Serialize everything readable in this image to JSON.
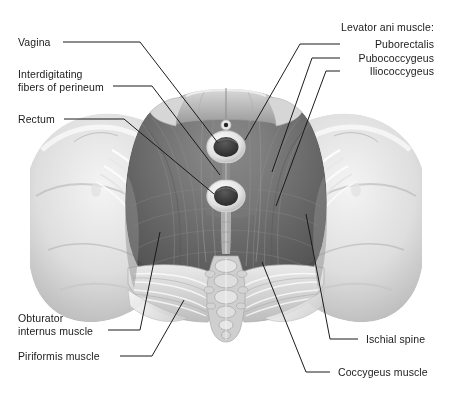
{
  "figure": {
    "background_color": "#ffffff",
    "label_color": "#1a1a1a",
    "leader_color": "#1b1b1b",
    "view": "inferior (perineal) view of the female bony pelvis and pelvic diaphragm",
    "rendering": "grayscale medical illustration"
  },
  "labels": {
    "vagina": "Vagina",
    "interdigitating_line1": "Interdigitating",
    "interdigitating_line2": "fibers of perineum",
    "rectum": "Rectum",
    "obturator_line1": "Obturator",
    "obturator_line2": "internus muscle",
    "piriformis": "Piriformis muscle",
    "levator_heading": "Levator ani muscle:",
    "puborectalis": "Puborectalis",
    "pubococcygeus": "Pubococcygeus",
    "iliococcygeus": "Iliococcygeus",
    "ischial_spine": "Ischial spine",
    "coccygeus": "Coccygeus muscle"
  },
  "structures": [
    {
      "name": "pubic-symphysis",
      "tone": "#b9b9b9"
    },
    {
      "name": "hip-bone-left",
      "tone": "#dcdcdc"
    },
    {
      "name": "hip-bone-right",
      "tone": "#dcdcdc"
    },
    {
      "name": "ischial-spine-left",
      "tone": "#e6e6e6"
    },
    {
      "name": "ischial-spine-right",
      "tone": "#e6e6e6"
    },
    {
      "name": "sacrotuberous-ligament-left",
      "tone": "#efefef"
    },
    {
      "name": "sacrotuberous-ligament-right",
      "tone": "#efefef"
    },
    {
      "name": "levator-ani-sheet",
      "tone": "#6f6f6f"
    },
    {
      "name": "puborectalis-sling",
      "tone": "#7a7a7a"
    },
    {
      "name": "pubococcygeus",
      "tone": "#636363"
    },
    {
      "name": "iliococcygeus",
      "tone": "#5c5c5c"
    },
    {
      "name": "coccygeus-left",
      "tone": "#cfcfcf"
    },
    {
      "name": "coccygeus-right",
      "tone": "#cfcfcf"
    },
    {
      "name": "sacrum-coccyx",
      "tone": "#c8c8c8"
    },
    {
      "name": "vaginal-opening",
      "tone": "#3a3a3a"
    },
    {
      "name": "anal-opening",
      "tone": "#3a3a3a"
    },
    {
      "name": "urethral-opening",
      "tone": "#2e2e2e"
    },
    {
      "name": "perineal-body",
      "tone": "#8a8a8a"
    }
  ]
}
